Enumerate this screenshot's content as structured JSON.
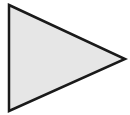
{
  "shape": {
    "type": "triangle",
    "direction": "right",
    "points": [
      [
        9,
        5
      ],
      [
        125,
        59
      ],
      [
        9,
        111
      ]
    ],
    "fill": "#e6e6e6",
    "stroke": "#1a1a1a",
    "stroke_width": 2.5
  }
}
